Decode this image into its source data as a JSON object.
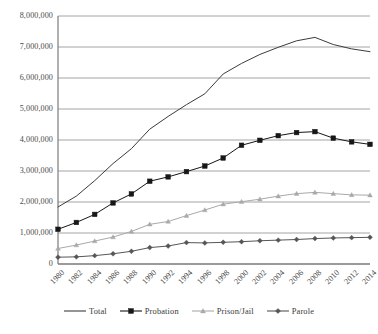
{
  "chart_data": {
    "type": "line",
    "title": "",
    "xlabel": "",
    "ylabel": "",
    "grid": true,
    "legend_position": "bottom",
    "ylim": [
      0,
      8000000
    ],
    "yticks": [
      0,
      1000000,
      2000000,
      3000000,
      4000000,
      5000000,
      6000000,
      7000000,
      8000000
    ],
    "ytick_labels": [
      "0",
      "1,000,000",
      "2,000,000",
      "3,000,000",
      "4,000,000",
      "5,000,000",
      "6,000,000",
      "7,000,000",
      "8,000,000"
    ],
    "x": [
      1980,
      1982,
      1984,
      1986,
      1988,
      1990,
      1992,
      1994,
      1996,
      1998,
      2000,
      2002,
      2004,
      2006,
      2008,
      2010,
      2012,
      2014
    ],
    "xtick_labels": [
      "1980",
      "1982",
      "1984",
      "1986",
      "1988",
      "1990",
      "1992",
      "1994",
      "1996",
      "1998",
      "2000",
      "2002",
      "2004",
      "2006",
      "2008",
      "2010",
      "2012",
      "2014"
    ],
    "series": [
      {
        "name": "Total",
        "marker": "none",
        "color": "#3c3c3c",
        "values": [
          1840000,
          2190000,
          2690000,
          3240000,
          3720000,
          4350000,
          4760000,
          5140000,
          5490000,
          6130000,
          6470000,
          6760000,
          6990000,
          7200000,
          7310000,
          7080000,
          6940000,
          6850000
        ]
      },
      {
        "name": "Probation",
        "marker": "square",
        "color": "#171717",
        "values": [
          1120000,
          1340000,
          1600000,
          1970000,
          2260000,
          2670000,
          2810000,
          2980000,
          3160000,
          3420000,
          3830000,
          3990000,
          4140000,
          4240000,
          4270000,
          4060000,
          3940000,
          3860000
        ]
      },
      {
        "name": "Prison/Jail",
        "marker": "triangle",
        "color": "#a9a9a9",
        "values": [
          500000,
          610000,
          740000,
          870000,
          1050000,
          1280000,
          1370000,
          1560000,
          1740000,
          1930000,
          2010000,
          2090000,
          2190000,
          2270000,
          2310000,
          2270000,
          2230000,
          2220000
        ]
      },
      {
        "name": "Parole",
        "marker": "diamond",
        "color": "#565656",
        "values": [
          220000,
          230000,
          270000,
          330000,
          410000,
          530000,
          580000,
          690000,
          680000,
          700000,
          720000,
          750000,
          770000,
          790000,
          820000,
          840000,
          850000,
          860000
        ]
      }
    ]
  },
  "legend": {
    "items": [
      {
        "label": "Total",
        "marker": "line",
        "color": "#3c3c3c"
      },
      {
        "label": "Probation",
        "marker": "square",
        "color": "#171717"
      },
      {
        "label": "Prison/Jail",
        "marker": "triangle",
        "color": "#a9a9a9"
      },
      {
        "label": "Parole",
        "marker": "diamond",
        "color": "#565656"
      }
    ]
  }
}
